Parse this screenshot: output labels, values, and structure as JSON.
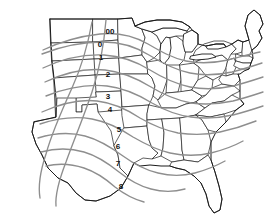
{
  "map": {
    "title": "United States Time-Zone / Isoline Contour Map",
    "region": "Eastern and Central United States",
    "background_color": "#ffffff",
    "border_color": "#2b2b2b",
    "coastline_color": "#1a1a1a",
    "contour_color": "#8e8e8e",
    "label_color": "#101010",
    "zone_labels": [
      {
        "id": "zone-00",
        "text": "00",
        "x": 110,
        "y": 32
      },
      {
        "id": "zone-0",
        "text": "0",
        "x": 100,
        "y": 45
      },
      {
        "id": "zone-1",
        "text": "1",
        "x": 101,
        "y": 58
      },
      {
        "id": "zone-2",
        "text": "2",
        "x": 108,
        "y": 75
      },
      {
        "id": "zone-3",
        "text": "3",
        "x": 108,
        "y": 97
      },
      {
        "id": "zone-4",
        "text": "4",
        "x": 110,
        "y": 110
      },
      {
        "id": "zone-5",
        "text": "5",
        "x": 119,
        "y": 130
      },
      {
        "id": "zone-6",
        "text": "6",
        "x": 118,
        "y": 147
      },
      {
        "id": "zone-7",
        "text": "7",
        "x": 118,
        "y": 164
      },
      {
        "id": "zone-8",
        "text": "8",
        "x": 121,
        "y": 187
      }
    ],
    "lakes": [
      {
        "id": "lake-superior",
        "name": "Lake Superior"
      },
      {
        "id": "lake-michigan",
        "name": "Lake Michigan"
      },
      {
        "id": "lake-huron",
        "name": "Lake Huron"
      },
      {
        "id": "lake-erie",
        "name": "Lake Erie"
      },
      {
        "id": "lake-ontario",
        "name": "Lake Ontario"
      }
    ],
    "contour_count": 10
  }
}
